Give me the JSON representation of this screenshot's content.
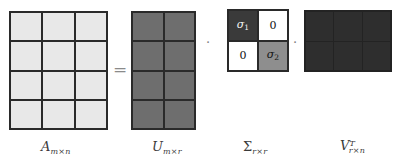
{
  "figure": {
    "equation_operators": {
      "equals": "=",
      "multiply_1": "·",
      "multiply_2": "·"
    },
    "matrices": [
      {
        "id": "A",
        "symbol": "A",
        "superscript": "",
        "subscript": "m×n",
        "label": "A m×n",
        "rows": 4,
        "cols": 3,
        "fill": "#e8e8e8",
        "border": "#2a2a2a",
        "cells": [
          [
            "",
            "",
            ""
          ],
          [
            "",
            "",
            ""
          ],
          [
            "",
            "",
            ""
          ],
          [
            "",
            "",
            ""
          ]
        ]
      },
      {
        "id": "U",
        "symbol": "U",
        "superscript": "",
        "subscript": "m×r",
        "label": "U m×r",
        "rows": 4,
        "cols": 2,
        "fill": "#6e6e6e",
        "border": "#2a2a2a",
        "cells": [
          [
            "",
            ""
          ],
          [
            "",
            ""
          ],
          [
            "",
            ""
          ],
          [
            "",
            ""
          ]
        ]
      },
      {
        "id": "Sigma",
        "symbol": "Σ",
        "superscript": "",
        "subscript": "r×r",
        "label": "Σ r×r",
        "rows": 2,
        "cols": 2,
        "fill": "#ffffff",
        "border": "#2a2a2a",
        "cells": [
          [
            "σ₁",
            "0"
          ],
          [
            "0",
            "σ₂"
          ]
        ],
        "cell_colors": [
          [
            "#3a3a3a",
            "#ffffff"
          ],
          [
            "#ffffff",
            "#8e8e8e"
          ]
        ]
      },
      {
        "id": "VT",
        "symbol": "V",
        "superscript": "T",
        "subscript": "r×n",
        "label": "V^T r×n",
        "rows": 2,
        "cols": 3,
        "fill": "#2e2e2e",
        "border": "#232323",
        "cells": [
          [
            "",
            "",
            ""
          ],
          [
            "",
            "",
            ""
          ]
        ]
      }
    ],
    "symbols": {
      "sigma_1_base": "σ",
      "sigma_1_index": "1",
      "sigma_2_base": "σ",
      "sigma_2_index": "2",
      "zero_top_right": "0",
      "zero_bottom_left": "0"
    },
    "label_parts": {
      "a_symbol": "A",
      "a_sub": "m×n",
      "u_symbol": "U",
      "u_sub": "m×r",
      "sigma_symbol": "Σ",
      "sigma_sub": "r×r",
      "v_symbol": "V",
      "v_sup": "T",
      "v_sub": "r×n"
    }
  }
}
